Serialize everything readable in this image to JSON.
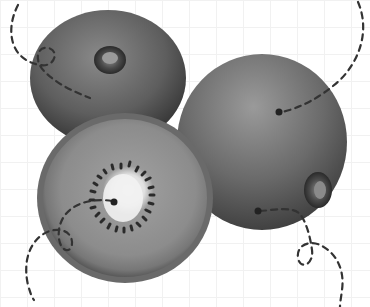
{
  "image": {
    "subject": "Three kiwifruits with dashed annotation lines",
    "width": 370,
    "height": 307,
    "background_color": "#ffffff",
    "grid_color": "#f1f1f1",
    "fruits": [
      {
        "name": "whole kiwi (top left)",
        "cx": 108,
        "cy": 75,
        "rx": 78,
        "ry": 68
      },
      {
        "name": "whole kiwi (right)",
        "cx": 262,
        "cy": 140,
        "rx": 85,
        "ry": 86
      },
      {
        "name": "halved kiwi (bottom left)",
        "cx": 125,
        "cy": 198,
        "rx": 88,
        "ry": 84
      }
    ],
    "annotation_color": "#333333",
    "annotation_dots": [
      {
        "x": 279,
        "y": 112
      },
      {
        "x": 114,
        "y": 202
      },
      {
        "x": 258,
        "y": 211
      }
    ]
  }
}
